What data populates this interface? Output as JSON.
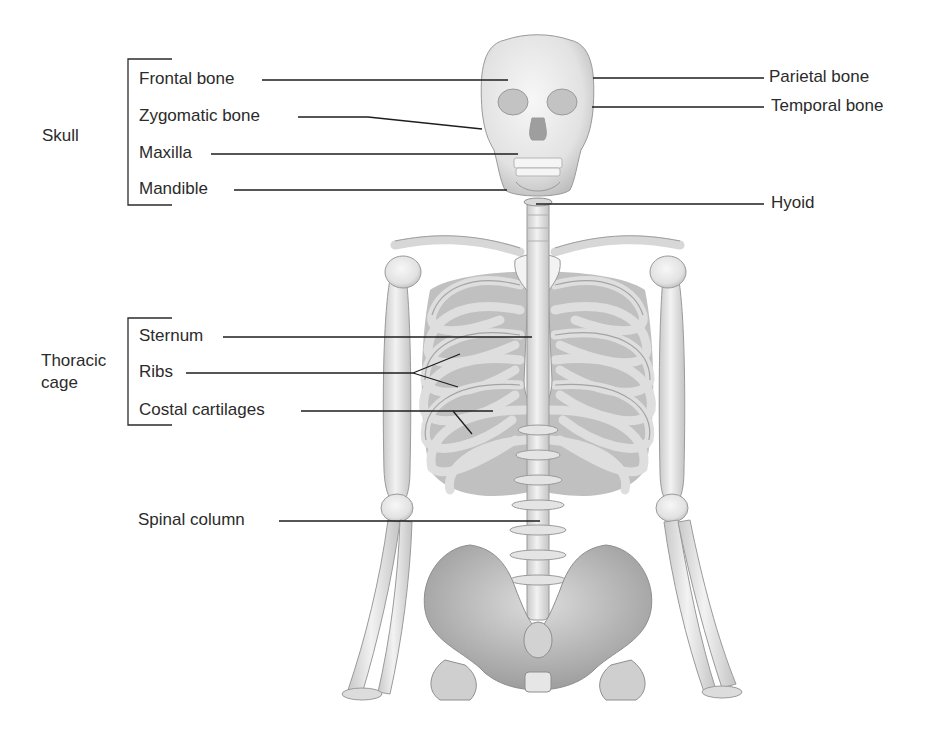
{
  "diagram": {
    "type": "anatomical-labeled-illustration",
    "groups": [
      {
        "name": "Skull",
        "label": "Skull",
        "members": [
          "Frontal bone",
          "Zygomatic bone",
          "Maxilla",
          "Mandible"
        ]
      },
      {
        "name": "Thoracic cage",
        "label_line1": "Thoracic",
        "label_line2": "cage",
        "members": [
          "Sternum",
          "Ribs",
          "Costal cartilages"
        ]
      }
    ],
    "left_labels": {
      "frontal": "Frontal bone",
      "zygomatic": "Zygomatic bone",
      "maxilla": "Maxilla",
      "mandible": "Mandible",
      "sternum": "Sternum",
      "ribs": "Ribs",
      "costal": "Costal cartilages",
      "spinal": "Spinal column"
    },
    "right_labels": {
      "parietal": "Parietal bone",
      "temporal": "Temporal bone",
      "hyoid": "Hyoid"
    },
    "colors": {
      "background": "#ffffff",
      "text": "#2b2b2b",
      "leader_line": "#1e1e1e",
      "bone_fill": "#ececec",
      "bone_shade": "#bdbdbd",
      "bone_dark": "#8a8a8a"
    }
  }
}
